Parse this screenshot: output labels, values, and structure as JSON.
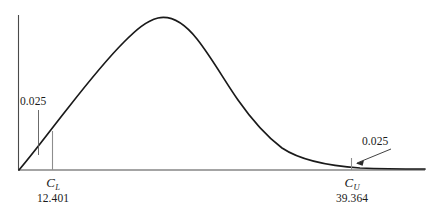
{
  "figure": {
    "background_color": "#ffffff",
    "line_color": "#1a1a1a",
    "axis_color": "#3c3c3c"
  },
  "labels": {
    "left_tail_area": "0.025",
    "right_tail_area": "0.025",
    "lower_symbol": "C",
    "lower_subscript": "L",
    "lower_value": "12.401",
    "upper_symbol": "C",
    "upper_subscript": "U",
    "upper_value": "39.364"
  },
  "chart_data": {
    "type": "area",
    "title": "",
    "subtitle": "",
    "xlabel": "",
    "ylabel": "",
    "grid": false,
    "legend": null,
    "distribution": "chi-square density curve with two-tailed rejection regions",
    "xlim": [
      0,
      60
    ],
    "ylim": [
      0,
      1
    ],
    "annotations": [
      {
        "name": "left-tail-area",
        "text": "0.025",
        "x": 12.401,
        "description": "area of lower tail left of C_L",
        "label_px": {
          "x": 20,
          "y": 96
        },
        "pointer_px": {
          "x": 38,
          "y1": 110,
          "y2": 155
        }
      },
      {
        "name": "right-tail-area",
        "text": "0.025",
        "x": 39.364,
        "description": "area of upper tail right of C_U",
        "label_px": {
          "x": 362,
          "y": 136
        },
        "pointer_px": {
          "x1": 392,
          "y1": 150,
          "x2": 357,
          "y2": 163
        }
      }
    ],
    "critical_values": [
      {
        "name": "C_L",
        "symbol": "C",
        "subscript": "L",
        "value": 12.401,
        "tail_area": 0.025,
        "px_x": 52
      },
      {
        "name": "C_U",
        "symbol": "C",
        "subscript": "U",
        "value": 39.364,
        "tail_area": 0.025,
        "px_x": 351
      }
    ],
    "axes_px": {
      "y_axis_x": 18,
      "y_axis_top": 15,
      "baseline_y": 170,
      "baseline_x1": 18,
      "baseline_x2": 425
    },
    "curve_px": {
      "start": [
        19,
        170
      ],
      "peak": [
        155,
        18
      ],
      "end": [
        425,
        169
      ],
      "path": "M 19,170 C 36,150 52,128 68,108 C 86,85 104,62 124,42 C 136,30 146,21 158,18 C 172,15 185,24 197,39 C 212,58 224,80 238,100 C 252,120 266,136 282,148 C 300,160 330,166 360,168 C 385,169 408,169 425,169"
    }
  }
}
